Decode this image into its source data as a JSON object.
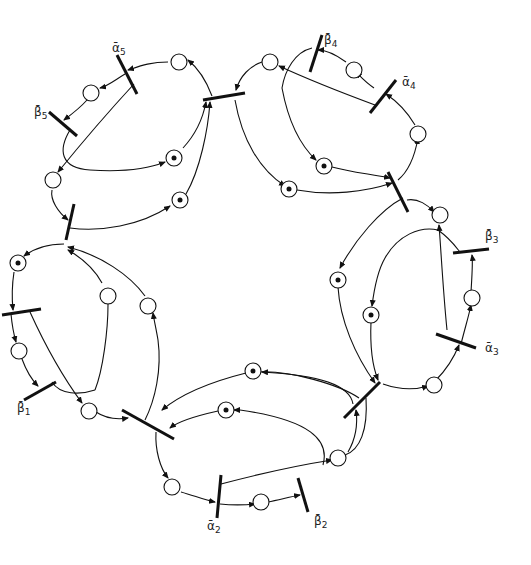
{
  "diagram": {
    "type": "petri-net",
    "labels": {
      "alpha1": "β̄",
      "a5": {
        "base": "ᾱ",
        "sub": "5"
      },
      "b5": {
        "base": "β̄",
        "sub": "5"
      },
      "a4": {
        "base": "ᾱ",
        "sub": "4"
      },
      "b4": {
        "base": "β̄",
        "sub": "4"
      },
      "a3": {
        "base": "ᾱ",
        "sub": "3"
      },
      "b3": {
        "base": "β̄",
        "sub": "3"
      },
      "a2": {
        "base": "ᾱ",
        "sub": "2"
      },
      "b2": {
        "base": "β̄",
        "sub": "2"
      },
      "b1": {
        "base": "β̄",
        "sub": "1"
      }
    },
    "marked_places": 10,
    "subnets": [
      {
        "id": 5,
        "transitions": [
          "alpha_5",
          "beta_5"
        ]
      },
      {
        "id": 4,
        "transitions": [
          "alpha_4",
          "beta_4"
        ]
      },
      {
        "id": 3,
        "transitions": [
          "alpha_3",
          "beta_3"
        ]
      },
      {
        "id": 2,
        "transitions": [
          "alpha_2",
          "beta_2"
        ]
      },
      {
        "id": 1,
        "transitions": [
          "beta_1"
        ]
      }
    ]
  }
}
